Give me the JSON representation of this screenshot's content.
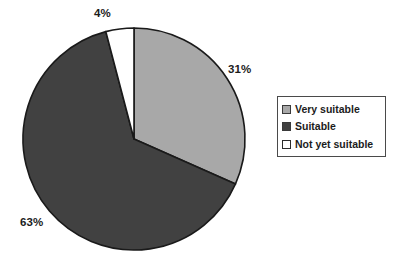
{
  "chart_data": {
    "type": "pie",
    "title": "",
    "categories": [
      "Very suitable",
      "Suitable",
      "Not yet suitable"
    ],
    "values": [
      31,
      63,
      4
    ],
    "value_labels": [
      "31%",
      "63%",
      "4%"
    ],
    "unit": "%",
    "start_angle_deg": 0,
    "direction": "clockwise",
    "legend": {
      "position": "right",
      "bordered": true,
      "entries": [
        {
          "label": "Very suitable",
          "value": 31,
          "display": "31%",
          "color": "#a8a8a8",
          "swatch_style": "light-gray"
        },
        {
          "label": "Suitable",
          "value": 63,
          "display": "63%",
          "color": "#414141",
          "swatch_style": "dark-gray"
        },
        {
          "label": "Not yet suitable",
          "value": 4,
          "display": "4%",
          "color": "#ffffff",
          "swatch_style": "white"
        }
      ]
    },
    "slice_outline_color": "#1a1a1a",
    "background": "#ffffff",
    "grid": false
  },
  "labels": {
    "very_suitable": "31%",
    "suitable": "63%",
    "not_yet_suitable": "4%"
  },
  "legend": {
    "items": [
      {
        "label": "Very suitable"
      },
      {
        "label": "Suitable"
      },
      {
        "label": "Not yet suitable"
      }
    ]
  },
  "colors": {
    "very_suitable": "#a8a8a8",
    "suitable": "#414141",
    "not_yet_suitable": "#ffffff",
    "outline": "#1a1a1a",
    "text": "#1c1c1c",
    "legend_border": "#4a4a4a",
    "background": "#ffffff"
  },
  "geometry": {
    "center_x": 134,
    "center_y": 139,
    "radius": 111
  }
}
